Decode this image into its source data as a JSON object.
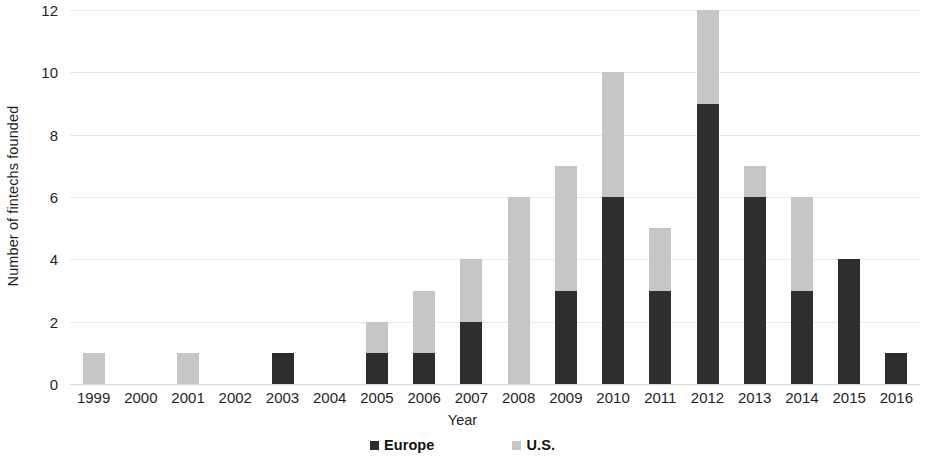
{
  "chart_data": {
    "type": "bar",
    "subtype": "stacked-bar",
    "title": "",
    "xlabel": "Year",
    "ylabel": "Number of fintechs founded",
    "categories": [
      "1999",
      "2000",
      "2001",
      "2002",
      "2003",
      "2004",
      "2005",
      "2006",
      "2007",
      "2008",
      "2009",
      "2010",
      "2011",
      "2012",
      "2013",
      "2014",
      "2015",
      "2016"
    ],
    "series": [
      {
        "name": "Europe",
        "color": "#2e2e2e",
        "values": [
          0,
          0,
          0,
          0,
          1,
          0,
          1,
          1,
          2,
          0,
          3,
          6,
          3,
          9,
          6,
          3,
          4,
          1
        ]
      },
      {
        "name": "U.S.",
        "color": "#c6c6c6",
        "values": [
          1,
          0,
          1,
          0,
          0,
          0,
          1,
          2,
          2,
          6,
          4,
          4,
          2,
          3,
          1,
          3,
          0,
          0
        ]
      }
    ],
    "totals": [
      1,
      0,
      1,
      0,
      1,
      0,
      2,
      3,
      4,
      6,
      7,
      10,
      5,
      12,
      7,
      6,
      4,
      1
    ],
    "ylim": [
      0,
      12
    ],
    "y_ticks": [
      "0",
      "2",
      "4",
      "6",
      "8",
      "10",
      "12"
    ],
    "y_tick_values": [
      0,
      2,
      4,
      6,
      8,
      10,
      12
    ],
    "grid": true,
    "grid_axis": "y",
    "legend_position": "bottom",
    "legend": [
      {
        "label": "Europe",
        "swatch": "europe"
      },
      {
        "label": "U.S.",
        "swatch": "us"
      }
    ]
  }
}
